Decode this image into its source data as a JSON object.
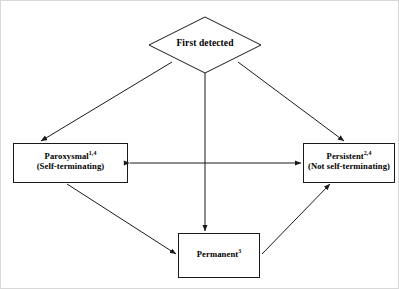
{
  "diagram": {
    "type": "flowchart",
    "title_visible": false,
    "background_color": "#ffffff",
    "stroke_color": "#1a1a1a",
    "text_color": "#000000",
    "frame_color": "#d8d8d8",
    "nodes": [
      {
        "id": "first-detected",
        "shape": "diamond",
        "lines": [
          {
            "text": "First detected",
            "superscript": ""
          }
        ]
      },
      {
        "id": "paroxysmal",
        "shape": "rectangle",
        "lines": [
          {
            "text": "Paroxysmal",
            "superscript": "1,4"
          },
          {
            "text": "(Self-terminating)",
            "superscript": ""
          }
        ]
      },
      {
        "id": "persistent",
        "shape": "rectangle",
        "lines": [
          {
            "text": "Persistent",
            "superscript": "2,4"
          },
          {
            "text": "(Not self-terminating)",
            "superscript": ""
          }
        ]
      },
      {
        "id": "permanent",
        "shape": "rectangle",
        "lines": [
          {
            "text": "Permanent",
            "superscript": "3"
          }
        ]
      }
    ],
    "edges": [
      {
        "id": "first-to-paroxysmal",
        "from": "first-detected",
        "to": "paroxysmal",
        "style": "single-arrow"
      },
      {
        "id": "first-to-persistent",
        "from": "first-detected",
        "to": "persistent",
        "style": "single-arrow"
      },
      {
        "id": "first-to-permanent",
        "from": "first-detected",
        "to": "permanent",
        "style": "single-arrow"
      },
      {
        "id": "paroxysmal-persistent",
        "from": "paroxysmal",
        "to": "persistent",
        "style": "double-arrow"
      },
      {
        "id": "paroxysmal-to-permanent",
        "from": "paroxysmal",
        "to": "permanent",
        "style": "single-arrow"
      },
      {
        "id": "permanent-to-persistent",
        "from": "permanent",
        "to": "persistent",
        "style": "single-arrow"
      }
    ]
  }
}
